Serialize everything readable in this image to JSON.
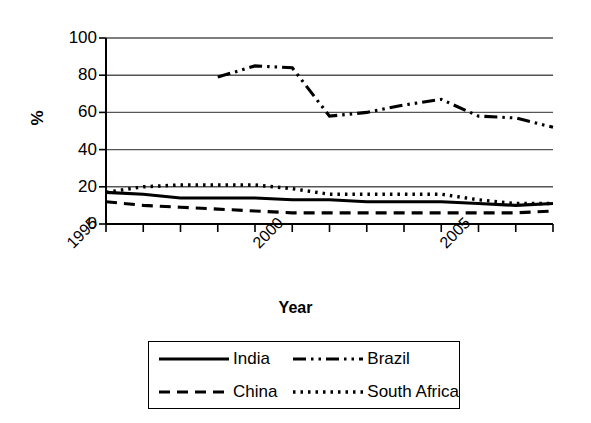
{
  "chart_data": {
    "type": "line",
    "title": "",
    "xlabel": "Year",
    "ylabel": "%",
    "xlim": [
      1995,
      2007
    ],
    "ylim": [
      0,
      100
    ],
    "grid": true,
    "legend_position": "bottom",
    "y_ticks": [
      0,
      20,
      40,
      60,
      80,
      100
    ],
    "y_tick_labels": [
      "0",
      "20",
      "40",
      "60",
      "80",
      "100"
    ],
    "x_ticks": [
      1995,
      1996,
      1997,
      1998,
      1999,
      2000,
      2001,
      2002,
      2003,
      2004,
      2005,
      2006,
      2007
    ],
    "x_tick_labels": [
      "1995",
      "",
      "",
      "",
      "",
      "2000",
      "",
      "",
      "",
      "",
      "2005",
      "",
      ""
    ],
    "x": [
      1995,
      1996,
      1997,
      1998,
      1999,
      2000,
      2001,
      2002,
      2003,
      2004,
      2005,
      2006,
      2007
    ],
    "series": [
      {
        "name": "India",
        "style": "solid",
        "color": "#000000",
        "values": [
          17,
          16,
          14,
          14,
          14,
          13,
          13,
          12,
          12,
          12,
          11,
          10,
          11
        ]
      },
      {
        "name": "China",
        "style": "dashed",
        "color": "#000000",
        "values": [
          12,
          10,
          9,
          8,
          7,
          6,
          6,
          6,
          6,
          6,
          6,
          6,
          7
        ]
      },
      {
        "name": "Brazil",
        "style": "dash-dot-dot",
        "color": "#000000",
        "values": [
          null,
          null,
          null,
          79,
          85,
          84,
          58,
          60,
          64,
          67,
          58,
          57,
          52
        ]
      },
      {
        "name": "South Africa",
        "style": "dotted",
        "color": "#000000",
        "values": [
          17,
          20,
          21,
          21,
          21,
          19,
          16,
          16,
          16,
          16,
          13,
          11,
          11
        ]
      }
    ]
  },
  "legend": {
    "entries": [
      {
        "label": "India",
        "style": "solid"
      },
      {
        "label": "Brazil",
        "style": "dash-dot-dot"
      },
      {
        "label": "China",
        "style": "dashed"
      },
      {
        "label": "South Africa",
        "style": "dotted"
      }
    ]
  }
}
